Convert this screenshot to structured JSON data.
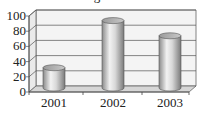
{
  "chart_data": {
    "type": "bar",
    "style": "3d-cylinder",
    "title": "...igure...",
    "categories": [
      "2001",
      "2002",
      "2003"
    ],
    "values": [
      28,
      90,
      70
    ],
    "xlabel": "",
    "ylabel": "",
    "ylim": [
      0,
      100
    ],
    "yticks": [
      "0",
      "20",
      "40",
      "60",
      "80",
      "100"
    ],
    "grid": true,
    "legend": null
  }
}
